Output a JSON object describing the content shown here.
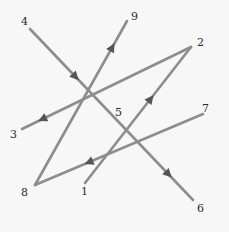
{
  "diagram": {
    "type": "numbered-path",
    "colors": {
      "line": "#8d8d8d",
      "arrow": "#555555",
      "label": "#2a2a2a",
      "background": "#f7f7f7"
    },
    "points": [
      {
        "id": "1",
        "label": "1"
      },
      {
        "id": "2",
        "label": "2"
      },
      {
        "id": "3",
        "label": "3"
      },
      {
        "id": "4",
        "label": "4"
      },
      {
        "id": "5",
        "label": "5"
      },
      {
        "id": "6",
        "label": "6"
      },
      {
        "id": "7",
        "label": "7"
      },
      {
        "id": "8",
        "label": "8"
      },
      {
        "id": "9",
        "label": "9"
      }
    ],
    "segments": [
      {
        "from": "1",
        "to": "2",
        "arrow": "toward-end"
      },
      {
        "from": "2",
        "to": "3",
        "arrow": "toward-end"
      },
      {
        "from": "4",
        "to": "6",
        "arrow": "toward-end",
        "via_label": "5"
      },
      {
        "from": "7",
        "to": "8",
        "arrow": "toward-end"
      },
      {
        "from": "8",
        "to": "9",
        "arrow": "toward-end"
      }
    ]
  }
}
